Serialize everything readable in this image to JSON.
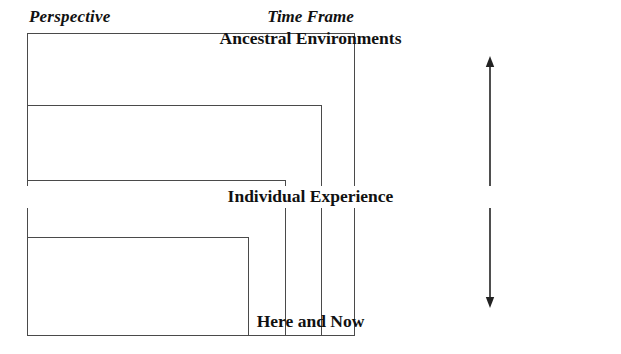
{
  "figure": {
    "background_color": "#ffffff",
    "line_color": "#4a4a4a",
    "text_color": "#111111"
  },
  "left_panel": {
    "title": "Perspective",
    "nested_rectangles": [
      {
        "name": "outer",
        "left": 27,
        "top": 33,
        "right": 355,
        "bottom": 336
      },
      {
        "name": "second",
        "left": 27,
        "top": 105,
        "right": 322,
        "bottom": 336
      },
      {
        "name": "third",
        "left": 27,
        "top": 180,
        "right": 286,
        "bottom": 336
      },
      {
        "name": "inner",
        "left": 27,
        "top": 237,
        "right": 249,
        "bottom": 336
      }
    ]
  },
  "right_panel": {
    "title": "Time Frame",
    "axis": {
      "orientation": "vertical",
      "double_headed": true,
      "x": 490,
      "top_tip_y": 56,
      "bottom_tip_y": 308
    },
    "labels": {
      "top": "Ancestral Environments",
      "middle": "Individual Experience",
      "bottom": "Here and Now"
    }
  }
}
